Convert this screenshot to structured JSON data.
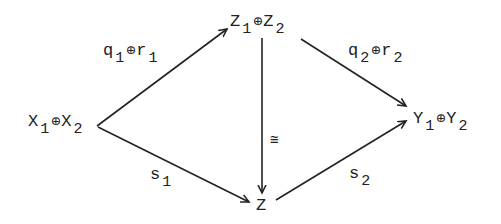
{
  "diagram": {
    "nodes": {
      "x": {
        "base1": "X",
        "sub1": "1",
        "op": "⊕",
        "base2": "X",
        "sub2": "2"
      },
      "z12": {
        "base1": "Z",
        "sub1": "1",
        "op": "⊕",
        "base2": "Z",
        "sub2": "2"
      },
      "y": {
        "base1": "Y",
        "sub1": "1",
        "op": "⊕",
        "base2": "Y",
        "sub2": "2"
      },
      "z": {
        "base": "Z"
      }
    },
    "edges": {
      "x_to_z12": {
        "base1": "q",
        "sub1": "1",
        "op": "⊕",
        "base2": "r",
        "sub2": "1"
      },
      "z12_to_y": {
        "base1": "q",
        "sub1": "2",
        "op": "⊕",
        "base2": "r",
        "sub2": "2"
      },
      "z12_to_z": {
        "symbol": "≅"
      },
      "x_to_z": {
        "base": "s",
        "sub": "1"
      },
      "z_to_y": {
        "base": "s",
        "sub": "2"
      }
    },
    "stroke_color": "#222222"
  }
}
